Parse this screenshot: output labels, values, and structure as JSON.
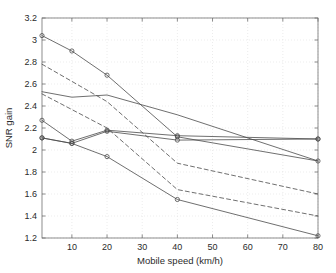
{
  "chart_data": {
    "type": "line",
    "title": "",
    "xlabel": "Mobile speed (km/h)",
    "ylabel": "SNR gain",
    "xlim": [
      1.5,
      80
    ],
    "ylim": [
      1.2,
      3.2
    ],
    "xticks": [
      10,
      20,
      30,
      40,
      50,
      60,
      70,
      80
    ],
    "xtick_labels": [
      "10",
      "20",
      "30",
      "40",
      "50",
      "60",
      "70",
      "80"
    ],
    "yticks": [
      1.2,
      1.4,
      1.6,
      1.8,
      2.0,
      2.2,
      2.4,
      2.6,
      2.8,
      3.0,
      3.2
    ],
    "ytick_labels": [
      "1.2",
      "1.4",
      "1.6",
      "1.8",
      "2",
      "2.2",
      "2.4",
      "2.6",
      "2.8",
      "3",
      "3.2"
    ],
    "grid": true,
    "legend": "none",
    "line_color": "#4a4a4a",
    "marker": "circle",
    "series": [
      {
        "name": "series-1-solid-top",
        "style": "solid",
        "markers": true,
        "x": [
          1.5,
          10,
          20,
          40,
          80
        ],
        "y": [
          3.04,
          2.9,
          2.68,
          2.12,
          1.9
        ]
      },
      {
        "name": "series-2-solid-upper-flat",
        "style": "solid",
        "markers": false,
        "x": [
          1.5,
          10,
          20,
          30,
          40,
          80
        ],
        "y": [
          2.53,
          2.48,
          2.5,
          2.41,
          2.32,
          1.9
        ]
      },
      {
        "name": "series-3-dashed-upper",
        "style": "dashed",
        "markers": false,
        "x": [
          1.5,
          20,
          40,
          80
        ],
        "y": [
          2.78,
          2.44,
          1.88,
          1.6
        ]
      },
      {
        "name": "series-4-dashed-lower",
        "style": "dashed",
        "markers": false,
        "x": [
          1.5,
          20,
          40,
          80
        ],
        "y": [
          2.51,
          2.2,
          1.64,
          1.4
        ]
      },
      {
        "name": "series-5-solid-flat-middle",
        "style": "solid",
        "markers": true,
        "x": [
          1.5,
          10,
          20,
          40,
          80
        ],
        "y": [
          2.27,
          2.08,
          2.18,
          2.13,
          2.1
        ]
      },
      {
        "name": "series-6-solid-flat-2_1",
        "style": "solid",
        "markers": true,
        "x": [
          1.5,
          10,
          20,
          40,
          80
        ],
        "y": [
          2.11,
          2.06,
          2.17,
          2.09,
          2.1
        ]
      },
      {
        "name": "series-7-solid-bottom",
        "style": "solid",
        "markers": true,
        "x": [
          1.5,
          10,
          20,
          40,
          80
        ],
        "y": [
          2.11,
          2.06,
          1.94,
          1.55,
          1.22
        ]
      }
    ]
  }
}
